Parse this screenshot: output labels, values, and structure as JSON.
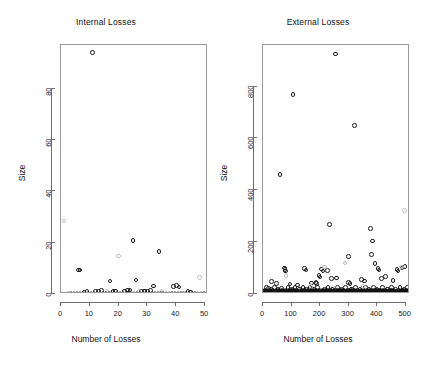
{
  "figure": {
    "background": "#ffffff",
    "foreground": "#1a1a1a",
    "axis_color": "#6e6e6e",
    "point_color": "#1b1b1b",
    "faint_point_color": "#bdbdbd"
  },
  "chart_data": [
    {
      "type": "scatter",
      "title": "Internal Losses",
      "xlabel": "Number of Losses",
      "ylabel": "Size",
      "xlim": [
        0,
        51
      ],
      "ylim": [
        0,
        97
      ],
      "xticks": [
        0,
        10,
        20,
        30,
        40,
        50
      ],
      "yticks": [
        0,
        20,
        40,
        60,
        80
      ],
      "xtick_labels": [
        "0",
        "10",
        "20",
        "30",
        "40",
        "50"
      ],
      "ytick_labels": [
        "0",
        "20",
        "40",
        "60",
        "80"
      ],
      "grid": false,
      "legend": null,
      "series": [
        {
          "name": "size-circles",
          "marker": "open-circle",
          "color": "#1b1b1b",
          "points": [
            [
              11,
              94
            ],
            [
              6,
              9.3
            ],
            [
              6.6,
              9.3
            ],
            [
              17,
              5.0
            ],
            [
              25,
              20.8
            ],
            [
              26,
              5.4
            ],
            [
              34,
              16.6
            ],
            [
              32,
              3.1
            ],
            [
              39,
              3.0
            ],
            [
              40,
              3.2
            ],
            [
              41,
              2.7
            ],
            [
              13,
              1.0
            ],
            [
              14,
              1.3
            ],
            [
              12,
              0.9
            ],
            [
              23,
              1.6
            ],
            [
              24,
              1.5
            ],
            [
              22,
              1.1
            ],
            [
              28,
              1.0
            ],
            [
              29,
              1.2
            ],
            [
              31,
              1.3
            ],
            [
              30,
              1.0
            ],
            [
              18,
              0.9
            ],
            [
              19,
              1.1
            ],
            [
              44,
              1.0
            ],
            [
              45,
              0.8
            ],
            [
              8,
              0.8
            ],
            [
              9,
              1.0
            ]
          ]
        },
        {
          "name": "size-faint-circles",
          "marker": "open-circle",
          "color": "#bdbdbd",
          "points": [
            [
              1,
              28.5
            ],
            [
              20,
              14.8
            ],
            [
              48,
              6.4
            ],
            [
              35,
              1.1
            ],
            [
              27,
              1.2
            ],
            [
              16,
              0.9
            ]
          ]
        },
        {
          "name": "baseline-crosses",
          "marker": "cross",
          "color": "#141414",
          "points": [
            [
              3,
              0.35
            ],
            [
              4,
              0.35
            ],
            [
              5,
              0.35
            ],
            [
              6,
              0.35
            ],
            [
              7,
              0.35
            ],
            [
              9,
              0.35
            ],
            [
              10,
              0.35
            ],
            [
              11,
              0.35
            ],
            [
              12,
              0.35
            ],
            [
              13,
              0.35
            ],
            [
              14,
              0.35
            ],
            [
              15,
              0.35
            ],
            [
              16,
              0.35
            ],
            [
              17,
              0.35
            ],
            [
              18,
              0.35
            ],
            [
              19,
              0.35
            ],
            [
              20,
              0.35
            ],
            [
              21,
              0.35
            ],
            [
              22,
              0.35
            ],
            [
              23,
              0.35
            ],
            [
              24,
              0.35
            ],
            [
              26,
              0.35
            ],
            [
              27,
              0.35
            ],
            [
              28,
              0.35
            ],
            [
              29,
              0.35
            ],
            [
              30,
              0.35
            ],
            [
              31,
              0.35
            ],
            [
              32,
              0.35
            ],
            [
              33,
              0.35
            ],
            [
              34,
              0.35
            ],
            [
              35,
              0.35
            ],
            [
              36,
              0.35
            ],
            [
              38,
              0.35
            ],
            [
              39,
              0.35
            ],
            [
              40,
              0.35
            ],
            [
              41,
              0.35
            ],
            [
              42,
              0.35
            ],
            [
              43,
              0.35
            ],
            [
              44,
              0.35
            ],
            [
              45,
              0.35
            ],
            [
              46,
              0.35
            ],
            [
              47,
              0.35
            ],
            [
              49,
              0.35
            ],
            [
              50,
              0.35
            ]
          ]
        }
      ]
    },
    {
      "type": "scatter",
      "title": "External Losses",
      "xlabel": "Number of Losses",
      "ylabel": "Size",
      "xlim": [
        0,
        515
      ],
      "ylim": [
        0,
        960
      ],
      "xticks": [
        0,
        100,
        200,
        300,
        400,
        500
      ],
      "yticks": [
        0,
        200,
        400,
        600,
        800
      ],
      "xtick_labels": [
        "0",
        "100",
        "200",
        "300",
        "400",
        "500"
      ],
      "ytick_labels": [
        "0",
        "200",
        "400",
        "600",
        "800"
      ],
      "grid": false,
      "legend": null,
      "series": [
        {
          "name": "size-circles",
          "marker": "open-circle",
          "color": "#1b1b1b",
          "points": [
            [
              255,
              925
            ],
            [
              105,
              770
            ],
            [
              320,
              650
            ],
            [
              60,
              460
            ],
            [
              232,
              268
            ],
            [
              377,
              252
            ],
            [
              383,
              205
            ],
            [
              300,
              145
            ],
            [
              380,
              152
            ],
            [
              393,
              118
            ],
            [
              403,
              98
            ],
            [
              406,
              92
            ],
            [
              470,
              95
            ],
            [
              473,
              88
            ],
            [
              487,
              100
            ],
            [
              498,
              105
            ],
            [
              75,
              100
            ],
            [
              77,
              95
            ],
            [
              78,
              88
            ],
            [
              145,
              98
            ],
            [
              150,
              92
            ],
            [
              205,
              96
            ],
            [
              210,
              88
            ],
            [
              225,
              90
            ],
            [
              196,
              72
            ],
            [
              200,
              66
            ],
            [
              240,
              60
            ],
            [
              258,
              62
            ],
            [
              345,
              56
            ],
            [
              355,
              50
            ],
            [
              415,
              60
            ],
            [
              430,
              68
            ],
            [
              455,
              52
            ],
            [
              300,
              44
            ],
            [
              305,
              40
            ],
            [
              170,
              42
            ],
            [
              185,
              45
            ],
            [
              188,
              40
            ],
            [
              95,
              38
            ],
            [
              120,
              34
            ],
            [
              30,
              48
            ],
            [
              48,
              40
            ],
            [
              12,
              26
            ],
            [
              20,
              22
            ],
            [
              28,
              20
            ],
            [
              40,
              24
            ],
            [
              52,
              18
            ],
            [
              64,
              22
            ],
            [
              88,
              26
            ],
            [
              100,
              18
            ],
            [
              112,
              24
            ],
            [
              128,
              20
            ],
            [
              140,
              26
            ],
            [
              152,
              18
            ],
            [
              164,
              24
            ],
            [
              176,
              20
            ],
            [
              190,
              26
            ],
            [
              215,
              18
            ],
            [
              228,
              24
            ],
            [
              244,
              20
            ],
            [
              262,
              26
            ],
            [
              276,
              18
            ],
            [
              290,
              24
            ],
            [
              310,
              20
            ],
            [
              325,
              26
            ],
            [
              340,
              18
            ],
            [
              360,
              24
            ],
            [
              372,
              20
            ],
            [
              388,
              26
            ],
            [
              400,
              18
            ],
            [
              418,
              24
            ],
            [
              436,
              20
            ],
            [
              450,
              26
            ],
            [
              464,
              18
            ],
            [
              480,
              24
            ],
            [
              494,
              20
            ],
            [
              506,
              26
            ]
          ]
        },
        {
          "name": "size-faint-circles",
          "marker": "open-circle",
          "color": "#bdbdbd",
          "points": [
            [
              496,
              322
            ],
            [
              287,
              120
            ],
            [
              216,
              104
            ],
            [
              80,
              72
            ],
            [
              486,
              104
            ],
            [
              168,
              30
            ],
            [
              255,
              22
            ],
            [
              350,
              28
            ],
            [
              130,
              16
            ]
          ]
        },
        {
          "name": "baseline-crosses",
          "marker": "cross",
          "color": "#141414",
          "dense_band": true,
          "note": "dense near-zero band spanning full x range",
          "count": 500
        }
      ]
    }
  ],
  "panels": [
    {
      "id": "internal",
      "title": "Internal Losses",
      "x_axis_title": "Number of Losses",
      "y_axis_title": "Size",
      "xtick_labels": [
        "0",
        "10",
        "20",
        "30",
        "40",
        "50"
      ],
      "ytick_labels": [
        "0",
        "20",
        "40",
        "60",
        "80"
      ]
    },
    {
      "id": "external",
      "title": "External Losses",
      "x_axis_title": "Number of Losses",
      "y_axis_title": "Size",
      "xtick_labels": [
        "0",
        "100",
        "200",
        "300",
        "400",
        "500"
      ],
      "ytick_labels": [
        "0",
        "200",
        "400",
        "600",
        "800"
      ]
    }
  ]
}
